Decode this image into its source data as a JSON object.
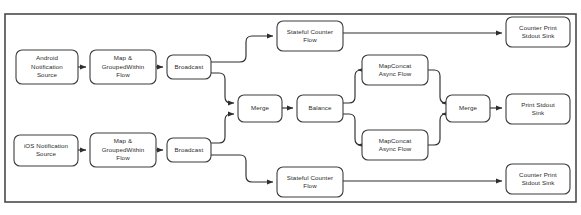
{
  "diagram": {
    "frame": {
      "x": 5,
      "y": 14,
      "width": 571,
      "height": 188
    },
    "colors": {
      "background": "#ffffff",
      "node_fill": "#ffffff",
      "node_stroke": "#3d3d3d",
      "edge_stroke": "#2e2e2e",
      "frame_stroke": "#4a4a4a",
      "text": "#2b2b2b"
    },
    "nodes": [
      {
        "id": "android-notification-source",
        "name": "android-notification-source",
        "lines": [
          "Android",
          "Notification",
          "Source"
        ],
        "x": 16,
        "y": 50,
        "width": 62,
        "height": 34
      },
      {
        "id": "map-groupedwithin-flow-android",
        "name": "map-groupedwithin-flow-android",
        "lines": [
          "Map &",
          "GroupedWithin",
          "Flow"
        ],
        "x": 90,
        "y": 50,
        "width": 66,
        "height": 34
      },
      {
        "id": "broadcast-android",
        "name": "broadcast-android",
        "lines": [
          "Broadcast"
        ],
        "x": 167,
        "y": 55,
        "width": 44,
        "height": 24
      },
      {
        "id": "ios-notification-source",
        "name": "ios-notification-source",
        "lines": [
          "iOS Notification",
          "Source"
        ],
        "x": 14,
        "y": 135,
        "width": 64,
        "height": 31
      },
      {
        "id": "map-groupedwithin-flow-ios",
        "name": "map-groupedwithin-flow-ios",
        "lines": [
          "Map &",
          "GroupedWithin",
          "Flow"
        ],
        "x": 90,
        "y": 133,
        "width": 66,
        "height": 34
      },
      {
        "id": "broadcast-ios",
        "name": "broadcast-ios",
        "lines": [
          "Broadcast"
        ],
        "x": 167,
        "y": 138,
        "width": 44,
        "height": 24
      },
      {
        "id": "stateful-counter-flow-top",
        "name": "stateful-counter-flow-top",
        "lines": [
          "Stateful Counter",
          "Flow"
        ],
        "x": 277,
        "y": 21,
        "width": 66,
        "height": 30
      },
      {
        "id": "counter-print-stdout-sink-top",
        "name": "counter-print-stdout-sink-top",
        "lines": [
          "Counter Print",
          "Stdout Sink"
        ],
        "x": 506,
        "y": 17,
        "width": 64,
        "height": 30
      },
      {
        "id": "merge-left",
        "name": "merge-left",
        "lines": [
          "Merge"
        ],
        "x": 238,
        "y": 95,
        "width": 44,
        "height": 27
      },
      {
        "id": "balance",
        "name": "balance",
        "lines": [
          "Balance"
        ],
        "x": 297,
        "y": 95,
        "width": 46,
        "height": 27
      },
      {
        "id": "mapconcat-async-flow-top",
        "name": "mapconcat-async-flow-top",
        "lines": [
          "MapConcat",
          "Async Flow"
        ],
        "x": 362,
        "y": 55,
        "width": 66,
        "height": 30
      },
      {
        "id": "mapconcat-async-flow-bottom",
        "name": "mapconcat-async-flow-bottom",
        "lines": [
          "MapConcat",
          "Async Flow"
        ],
        "x": 362,
        "y": 130,
        "width": 66,
        "height": 30
      },
      {
        "id": "merge-right",
        "name": "merge-right",
        "lines": [
          "Merge"
        ],
        "x": 446,
        "y": 95,
        "width": 44,
        "height": 27
      },
      {
        "id": "print-stdout-sink",
        "name": "print-stdout-sink",
        "lines": [
          "Print Stdout",
          "Sink"
        ],
        "x": 506,
        "y": 94,
        "width": 64,
        "height": 30
      },
      {
        "id": "stateful-counter-flow-bottom",
        "name": "stateful-counter-flow-bottom",
        "lines": [
          "Stateful Counter",
          "Flow"
        ],
        "x": 277,
        "y": 167,
        "width": 66,
        "height": 30
      },
      {
        "id": "counter-print-stdout-sink-bottom",
        "name": "counter-print-stdout-sink-bottom",
        "lines": [
          "Counter Print",
          "Stdout Sink"
        ],
        "x": 506,
        "y": 164,
        "width": 64,
        "height": 30
      }
    ],
    "edges": [
      {
        "id": "edge-android-source-to-map",
        "name": "edge-android-source-to-map",
        "from": "android-notification-source",
        "to": "map-groupedwithin-flow-android",
        "path": "M 78 67 L 86 67"
      },
      {
        "id": "edge-android-map-to-broadcast",
        "name": "edge-android-map-to-broadcast",
        "from": "map-groupedwithin-flow-android",
        "to": "broadcast-android",
        "path": "M 156 67 L 163 67"
      },
      {
        "id": "edge-broadcast-android-to-stateful-top",
        "name": "edge-broadcast-android-to-stateful-top",
        "from": "broadcast-android",
        "to": "stateful-counter-flow-top",
        "path": "M 211 62 L 240 62 Q 246 62 246 56 L 246 42 Q 246 36 252 36 L 273 36"
      },
      {
        "id": "edge-broadcast-android-to-merge-left",
        "name": "edge-broadcast-android-to-merge-left",
        "from": "broadcast-android",
        "to": "merge-left",
        "path": "M 211 73 L 219 73 Q 225 73 225 79 L 225 97 Q 225 103 231 103 L 234 103"
      },
      {
        "id": "edge-ios-source-to-map",
        "name": "edge-ios-source-to-map",
        "from": "ios-notification-source",
        "to": "map-groupedwithin-flow-ios",
        "path": "M 78 150 L 86 150"
      },
      {
        "id": "edge-ios-map-to-broadcast",
        "name": "edge-ios-map-to-broadcast",
        "from": "map-groupedwithin-flow-ios",
        "to": "broadcast-ios",
        "path": "M 156 150 L 163 150"
      },
      {
        "id": "edge-broadcast-ios-to-merge-left",
        "name": "edge-broadcast-ios-to-merge-left",
        "from": "broadcast-ios",
        "to": "merge-left",
        "path": "M 211 143 L 219 143 Q 225 143 225 137 L 225 120 Q 225 114 231 114 L 234 114"
      },
      {
        "id": "edge-broadcast-ios-to-stateful-bottom",
        "name": "edge-broadcast-ios-to-stateful-bottom",
        "from": "broadcast-ios",
        "to": "stateful-counter-flow-bottom",
        "path": "M 211 155 L 240 155 Q 246 155 246 161 L 246 176 Q 246 182 252 182 L 273 182"
      },
      {
        "id": "edge-merge-left-to-balance",
        "name": "edge-merge-left-to-balance",
        "from": "merge-left",
        "to": "balance",
        "path": "M 282 108 L 293 108"
      },
      {
        "id": "edge-balance-to-mapconcat-top",
        "name": "edge-balance-to-mapconcat-top",
        "from": "balance",
        "to": "mapconcat-async-flow-top",
        "path": "M 343 103 L 349 103 Q 355 103 355 97 L 355 76 Q 355 70 361 70 L 358 70"
      },
      {
        "id": "edge-balance-to-mapconcat-bottom",
        "name": "edge-balance-to-mapconcat-bottom",
        "from": "balance",
        "to": "mapconcat-async-flow-bottom",
        "path": "M 343 114 L 349 114 Q 355 114 355 120 L 355 139 Q 355 145 361 145 L 358 145"
      },
      {
        "id": "edge-mapconcat-top-to-merge-right",
        "name": "edge-mapconcat-top-to-merge-right",
        "from": "mapconcat-async-flow-top",
        "to": "merge-right",
        "path": "M 428 70 L 434 70 Q 440 70 440 76 L 440 97 Q 440 103 446 103 L 442 103"
      },
      {
        "id": "edge-mapconcat-bottom-to-merge-right",
        "name": "edge-mapconcat-bottom-to-merge-right",
        "from": "mapconcat-async-flow-bottom",
        "to": "merge-right",
        "path": "M 428 145 L 434 145 Q 440 145 440 139 L 440 120 Q 440 114 446 114 L 442 114"
      },
      {
        "id": "edge-merge-right-to-print-sink",
        "name": "edge-merge-right-to-print-sink",
        "from": "merge-right",
        "to": "print-stdout-sink",
        "path": "M 490 108 L 502 108"
      },
      {
        "id": "edge-stateful-top-to-counter-sink-top",
        "name": "edge-stateful-top-to-counter-sink-top",
        "from": "stateful-counter-flow-top",
        "to": "counter-print-stdout-sink-top",
        "path": "M 343 33 L 502 33"
      },
      {
        "id": "edge-stateful-bottom-to-counter-sink-bottom",
        "name": "edge-stateful-bottom-to-counter-sink-bottom",
        "from": "stateful-counter-flow-bottom",
        "to": "counter-print-stdout-sink-bottom",
        "path": "M 343 181 L 502 181"
      }
    ]
  }
}
